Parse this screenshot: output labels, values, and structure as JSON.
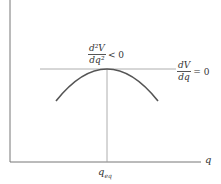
{
  "diagram": {
    "type": "potential-energy-maximum",
    "axes": {
      "x_label": "q",
      "y_label": "",
      "x_tick_label": "q",
      "x_tick_subscript": "eq"
    },
    "annotations": {
      "second_derivative": {
        "numerator": "d²V",
        "denominator": "dq²",
        "relation": "< 0"
      },
      "first_derivative": {
        "numerator": "dV",
        "denominator": "dq",
        "relation": "= 0"
      }
    },
    "colors": {
      "curve": "#555555",
      "axis": "#777777",
      "guide_line": "#999999",
      "text": "#333333"
    },
    "geometry": {
      "origin": [
        10,
        162
      ],
      "peak": [
        107,
        69
      ],
      "curve_left_end": [
        56,
        101
      ],
      "curve_right_end": [
        158,
        101
      ],
      "tangent_line_x": [
        40,
        176
      ]
    }
  }
}
